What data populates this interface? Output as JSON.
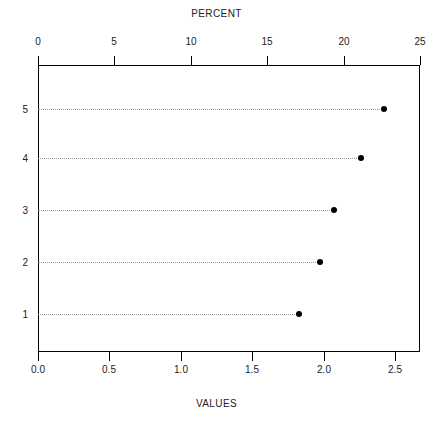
{
  "chart_data": {
    "type": "scatter",
    "title": "PERCENT",
    "xlabel": "VALUES",
    "ylabel": "",
    "categories": [
      "1",
      "2",
      "3",
      "4",
      "5"
    ],
    "series": [
      {
        "name": "percent",
        "values": [
          17.1,
          18.5,
          19.4,
          21.1,
          22.6
        ]
      },
      {
        "name": "values",
        "values": [
          1.85,
          2.0,
          2.1,
          2.3,
          2.47
        ]
      }
    ],
    "top_axis": {
      "label": "PERCENT",
      "ticks": [
        "0",
        "5",
        "10",
        "15",
        "20",
        "25"
      ],
      "tick_values": [
        0,
        5,
        10,
        15,
        20,
        25
      ],
      "range": [
        0,
        25
      ]
    },
    "bottom_axis": {
      "label": "VALUES",
      "ticks": [
        "0.0",
        "0.5",
        "1.0",
        "1.5",
        "2.0",
        "2.5"
      ],
      "tick_values": [
        0.0,
        0.5,
        1.0,
        1.5,
        2.0,
        2.5
      ],
      "range": [
        0.0,
        2.68
      ]
    },
    "y_axis": {
      "ticks": [
        "5",
        "4",
        "3",
        "2",
        "1"
      ],
      "tick_values": [
        5,
        4,
        3,
        2,
        1
      ]
    },
    "points": [
      {
        "row": "5",
        "percent": 22.6,
        "value": 2.47
      },
      {
        "row": "4",
        "percent": 21.1,
        "value": 2.3
      },
      {
        "row": "3",
        "percent": 19.4,
        "value": 2.1
      },
      {
        "row": "2",
        "percent": 18.5,
        "value": 2.0
      },
      {
        "row": "1",
        "percent": 17.1,
        "value": 1.85
      }
    ],
    "grid": true,
    "grid_style": "dotted-horizontal",
    "legend": null,
    "colors": {
      "point": "#000000",
      "frame": "#000000",
      "grid": "#999999",
      "text": "#222222",
      "background": "#ffffff"
    }
  },
  "geometry": {
    "plot_left": 38,
    "plot_right": 420,
    "plot_top": 65,
    "plot_bottom": 352,
    "row_y": [
      109,
      158,
      210,
      262,
      314
    ],
    "point_x": [
      384,
      361,
      334,
      320,
      299
    ],
    "top_tick_x": [
      38,
      114,
      191,
      267,
      344,
      420
    ],
    "bottom_tick_x": [
      38,
      109,
      181,
      252,
      324,
      395
    ]
  }
}
